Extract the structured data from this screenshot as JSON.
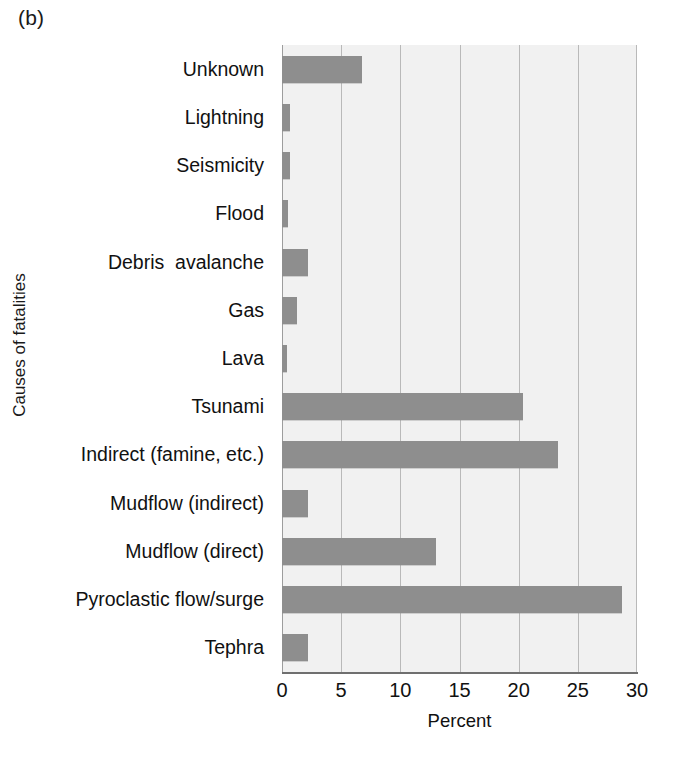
{
  "figure": {
    "panel_letter": "(b)",
    "xlabel": "Percent",
    "ylabel": "Causes of fatalities"
  },
  "chart_data": {
    "type": "bar",
    "orientation": "horizontal",
    "title": "",
    "xlabel": "Percent",
    "ylabel": "Causes of fatalities",
    "xlim": [
      0,
      30
    ],
    "xticks": [
      0,
      5,
      10,
      15,
      20,
      25,
      30
    ],
    "xtick_labels": [
      "0",
      "5",
      "10",
      "15",
      "20",
      "25",
      "30"
    ],
    "grid": "vertical",
    "legend": "none",
    "bar_color": "#8e8e8e",
    "plot_background": "#f1f1f1",
    "categories": [
      "Unknown",
      "Lightning",
      "Seismicity",
      "Flood",
      "Debris  avalanche",
      "Gas",
      "Lava",
      "Tsunami",
      "Indirect (famine, etc.)",
      "Mudflow (indirect)",
      "Mudflow (direct)",
      "Pyroclastic flow/surge",
      "Tephra"
    ],
    "values": [
      6.8,
      0.7,
      0.7,
      0.5,
      2.2,
      1.3,
      0.4,
      20.4,
      23.3,
      2.2,
      13.0,
      28.7,
      2.2
    ]
  }
}
